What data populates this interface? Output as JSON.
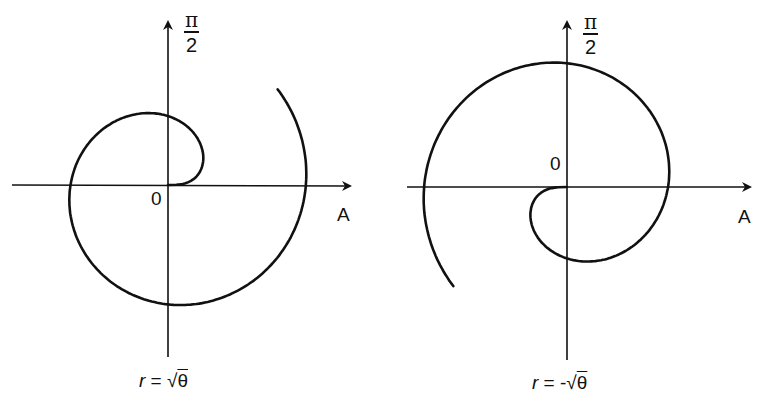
{
  "chart_data": [
    {
      "type": "line",
      "subtype": "polar-spiral",
      "title": "r = √θ",
      "equation": "r = sqrt(theta)",
      "sign": 1,
      "theta_range": [
        0,
        7.0
      ],
      "axis_labels": {
        "up": "π/2",
        "up_num": "π",
        "up_den": "2",
        "right": "A",
        "origin": "0"
      },
      "grid": false,
      "origin_px": [
        168,
        185
      ],
      "scale_px": 55,
      "axes_px": {
        "x": [
          12,
          352
        ],
        "y_top": 22,
        "y_bottom": 357
      }
    },
    {
      "type": "line",
      "subtype": "polar-spiral",
      "title": "r = -√θ",
      "equation": "r = -sqrt(theta)",
      "sign": -1,
      "theta_range": [
        0,
        7.0
      ],
      "axis_labels": {
        "up": "π/2",
        "up_num": "π",
        "up_den": "2",
        "right": "A",
        "origin": "0"
      },
      "grid": false,
      "origin_px": [
        185,
        187
      ],
      "scale_px": 57,
      "axes_px": {
        "x": [
          25,
          370
        ],
        "y_top": 22,
        "y_bottom": 360
      }
    }
  ],
  "left": {
    "up_num": "π",
    "up_den": "2",
    "right_label": "A",
    "origin_label": "0",
    "caption_r": "r",
    "caption_eq": " = ",
    "caption_sign": "",
    "caption_root": "√",
    "caption_theta": "θ"
  },
  "right": {
    "up_num": "π",
    "up_den": "2",
    "right_label": "A",
    "origin_label": "0",
    "caption_r": "r",
    "caption_eq": " = ",
    "caption_sign": "-",
    "caption_root": "√",
    "caption_theta": "θ"
  }
}
